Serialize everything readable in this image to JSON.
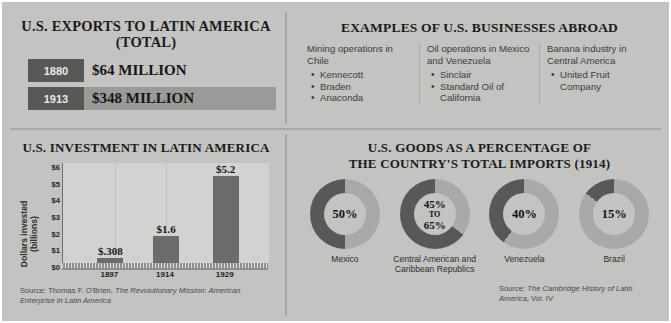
{
  "colors": {
    "background": "#c3c3c1",
    "dark": "#585856",
    "bar_gray": "#9a9a98",
    "chart_bar": "#6b6b69",
    "donut_dark": "#585856",
    "donut_light": "#a9a9a7",
    "plot_bg": "#d2d2d0"
  },
  "exports": {
    "title_line1": "U.S. EXPORTS TO LATIN AMERICA",
    "title_line2": "(TOTAL)",
    "rows": [
      {
        "year": "1880",
        "value": "$64 MILLION",
        "bar_width_pct": 22
      },
      {
        "year": "1913",
        "value": "$348 MILLION",
        "bar_width_pct": 100
      }
    ]
  },
  "businesses": {
    "title": "EXAMPLES OF U.S. BUSINESSES ABROAD",
    "columns": [
      {
        "heading": "Mining operations in Chile",
        "items": [
          "Kennecott",
          "Braden",
          "Anaconda"
        ]
      },
      {
        "heading": "Oil operations in Mexico and Venezuela",
        "items": [
          "Sinclair",
          "Standard Oil of California"
        ]
      },
      {
        "heading": "Banana industry in Central America",
        "items": [
          "United Fruit Company"
        ]
      }
    ]
  },
  "investment": {
    "title": "U.S. INVESTMENT IN LATIN AMERICA",
    "source": "Source: Thomas F. O'Brien, ",
    "source_italic": "The Revolutionary Mission: American Enterprise in Latin America"
  },
  "imports": {
    "title_line1": "U.S. GOODS AS A PERCENTAGE OF",
    "title_line2": "THE COUNTRY'S TOTAL IMPORTS (1914)",
    "source": "Source: ",
    "source_italic": "The Cambridge History of Latin America",
    "source_tail": ", Vol. IV"
  },
  "chart_data": [
    {
      "type": "bar",
      "title": "U.S. INVESTMENT IN LATIN AMERICA",
      "xlabel": "",
      "ylabel": "Dollars invested (billions)",
      "categories": [
        "1897",
        "1914",
        "1929"
      ],
      "values": [
        0.308,
        1.6,
        5.2
      ],
      "data_labels": [
        "$.308",
        "$1.6",
        "$5.2"
      ],
      "ylim": [
        0,
        6
      ],
      "yticks": [
        "$0",
        "$1",
        "$2",
        "$3",
        "$4",
        "$5",
        "$6"
      ],
      "grid": true,
      "legend": "none"
    },
    {
      "type": "bar",
      "title": "U.S. EXPORTS TO LATIN AMERICA (TOTAL)",
      "categories": [
        "1880",
        "1913"
      ],
      "values": [
        64,
        348
      ],
      "data_labels": [
        "$64 MILLION",
        "$348 MILLION"
      ],
      "ylabel": "Millions of dollars",
      "orientation": "horizontal"
    },
    {
      "type": "pie",
      "title": "U.S. GOODS AS A PERCENTAGE OF THE COUNTRY'S TOTAL IMPORTS (1914)",
      "categories": [
        "Mexico",
        "Central American and Caribbean Republics",
        "Venezuela",
        "Brazil"
      ],
      "values": [
        50,
        65,
        40,
        15
      ],
      "data_labels": [
        "50%",
        "45% TO 65%",
        "40%",
        "15%"
      ],
      "legend": "none"
    }
  ],
  "donuts": [
    {
      "label": "50%",
      "label2": "",
      "to": "",
      "caption": "Mexico",
      "fill": 50
    },
    {
      "label": "45%",
      "label2": "65%",
      "to": "TO",
      "caption": "Central American and Caribbean Republics",
      "fill": 65
    },
    {
      "label": "40%",
      "label2": "",
      "to": "",
      "caption": "Venezuela",
      "fill": 40
    },
    {
      "label": "15%",
      "label2": "",
      "to": "",
      "caption": "Brazil",
      "fill": 15
    }
  ]
}
